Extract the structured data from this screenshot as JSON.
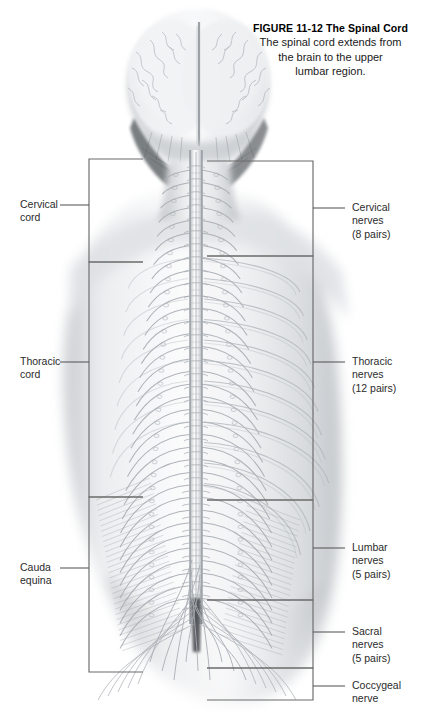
{
  "figure": {
    "number_title": "FIGURE 11-12  The Spinal Cord",
    "caption_lines": [
      "The spinal cord extends from",
      "the brain to the upper",
      "lumbar region."
    ]
  },
  "illustration": {
    "alt_name": "posterior-view-spinal-cord-illustration",
    "view": "posterior (back) view of head, neck, torso and pelvis",
    "structures": [
      "brain (cerebrum, posterior view with longitudinal fissure)",
      "cerebellum",
      "brainstem",
      "spinal cord",
      "vertebral column",
      "segmental spinal nerve roots",
      "ribs",
      "pelvis / sacrum",
      "cauda equina"
    ],
    "style": "grayscale airbrush and pencil medical illustration"
  },
  "labels_left": [
    {
      "id": "cervical-cord",
      "lines": [
        "Cervical",
        "cord"
      ]
    },
    {
      "id": "thoracic-cord",
      "lines": [
        "Thoracic",
        "cord"
      ]
    },
    {
      "id": "cauda-equina",
      "lines": [
        "Cauda",
        "equina"
      ]
    }
  ],
  "labels_right": [
    {
      "id": "cervical-nerves",
      "lines": [
        "Cervical",
        "nerves",
        "(8 pairs)"
      ]
    },
    {
      "id": "thoracic-nerves",
      "lines": [
        "Thoracic",
        "nerves",
        "(12 pairs)"
      ]
    },
    {
      "id": "lumbar-nerves",
      "lines": [
        "Lumbar",
        "nerves",
        "(5 pairs)"
      ]
    },
    {
      "id": "sacral-nerves",
      "lines": [
        "Sacral",
        "nerves",
        "(5 pairs)"
      ]
    },
    {
      "id": "coccygeal-nerve",
      "lines": [
        "Coccygeal",
        "nerve"
      ]
    }
  ],
  "colors": {
    "background": "#ffffff",
    "text": "#1a1a1a",
    "leader_line": "#555555",
    "bracket_box": "#666666",
    "illustration_gray": "#9aa0a6"
  }
}
